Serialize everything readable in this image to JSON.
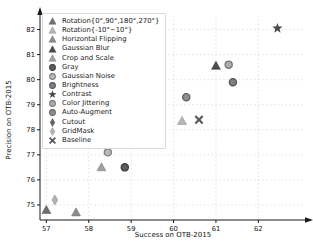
{
  "chart_data": {
    "type": "scatter",
    "title": "",
    "xlabel": "Success on OTB-2015",
    "ylabel": "Precision on OTB-2015",
    "xlim": [
      56.85,
      63.1
    ],
    "ylim": [
      74.4,
      82.7
    ],
    "xticks": [
      57,
      58,
      59,
      60,
      61,
      62
    ],
    "yticks": [
      75,
      76,
      77,
      78,
      79,
      80,
      81,
      82
    ],
    "grid": "dotted",
    "grid_color": "#cfcfcf",
    "axis_color": "#1a1a1a",
    "legend_position": "upper left",
    "series": [
      {
        "name": "Rotation{0°,90°,180°,270°}",
        "marker": "triangle",
        "color": "#6f6f6f",
        "x": 57.0,
        "y": 74.8
      },
      {
        "name": "Rotation{-10°~10°}",
        "marker": "triangle",
        "color": "#b5b5b5",
        "x": 60.2,
        "y": 78.35
      },
      {
        "name": "Horizontal Flipping",
        "marker": "triangle",
        "color": "#8c8c8c",
        "x": 57.7,
        "y": 74.7
      },
      {
        "name": "Gaussian Blur",
        "marker": "triangle",
        "color": "#4d4d4d",
        "x": 61.0,
        "y": 80.55
      },
      {
        "name": "Crop and Scale",
        "marker": "triangle",
        "color": "#9f9f9f",
        "x": 58.3,
        "y": 76.5
      },
      {
        "name": "Gray",
        "marker": "circle",
        "color": "#5d5d5d",
        "x": 58.85,
        "y": 76.5
      },
      {
        "name": "Gaussian Noise",
        "marker": "circle",
        "color": "#b9b9b9",
        "x": 58.45,
        "y": 77.1
      },
      {
        "name": "Brightness",
        "marker": "circle",
        "color": "#7f7f7f",
        "x": 61.4,
        "y": 79.9
      },
      {
        "name": "Contrast",
        "marker": "star",
        "color": "#4a4a4a",
        "x": 62.45,
        "y": 82.05
      },
      {
        "name": "Color Jittering",
        "marker": "circle",
        "color": "#adadad",
        "x": 61.3,
        "y": 80.6
      },
      {
        "name": "Auto-Augment",
        "marker": "circle",
        "color": "#909090",
        "x": 60.3,
        "y": 79.3
      },
      {
        "name": "Cutout",
        "marker": "diamond",
        "color": "#646464",
        "x": 59.4,
        "y": 77.5
      },
      {
        "name": "GridMask",
        "marker": "diamond",
        "color": "#b2b2b2",
        "x": 57.2,
        "y": 75.2
      },
      {
        "name": "Baseline",
        "marker": "x",
        "color": "#565656",
        "x": 60.6,
        "y": 78.4
      }
    ]
  }
}
